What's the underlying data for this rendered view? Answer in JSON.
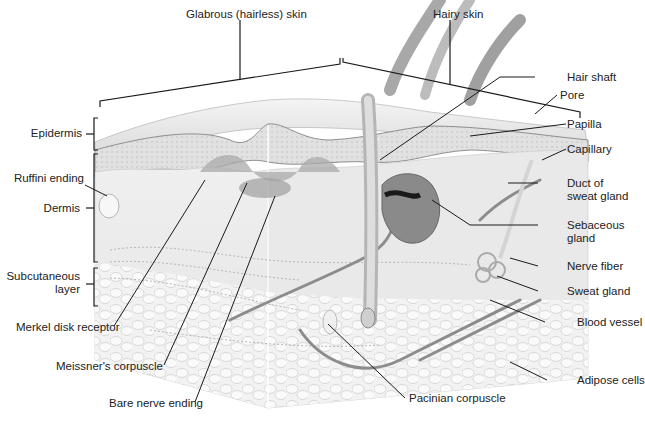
{
  "diagram": {
    "colors": {
      "background": "#ffffff",
      "line": "#1a1a1a",
      "epidermis": "#9a9a9a",
      "dermis": "#ececec",
      "subcutaneous": "#f3f3f3",
      "vessel": "#8c8c8c",
      "gland": "#7a7a7a",
      "label_text": "#222222"
    },
    "top_labels": {
      "glabrous": "Glabrous (hairless) skin",
      "hairy": "Hairy skin"
    },
    "left_labels": {
      "epidermis": "Epidermis",
      "ruffini": "Ruffini ending",
      "dermis": "Dermis",
      "subcutaneous_line1": "Subcutaneous",
      "subcutaneous_line2": "layer"
    },
    "bottom_labels": {
      "merkel": "Merkel disk receptor",
      "meissner": "Meissner's corpuscle",
      "bare_nerve": "Bare nerve ending",
      "pacinian": "Pacinian corpuscle"
    },
    "right_labels": {
      "hair_shaft": "Hair shaft",
      "pore": "Pore",
      "papilla": "Papilla",
      "capillary": "Capillary",
      "duct_line1": "Duct of",
      "duct_line2": "sweat gland",
      "sebaceous_line1": "Sebaceous",
      "sebaceous_line2": "gland",
      "nerve_fiber": "Nerve fiber",
      "sweat_gland": "Sweat gland",
      "blood_vessel": "Blood vessel",
      "adipose": "Adipose cells"
    }
  }
}
